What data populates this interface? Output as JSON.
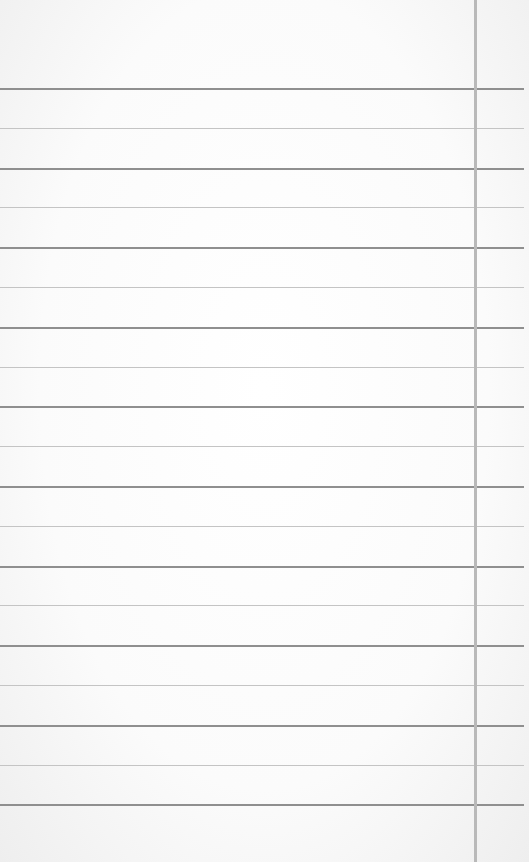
{
  "image": {
    "subject": "blank lined notebook paper",
    "rule_count": 19,
    "has_vertical_margin_line": true,
    "colors": {
      "paper": "#ffffff",
      "rule_dark": "#8f8f8f",
      "rule_light": "#c4c4c4",
      "margin_line": "#b9b9b9"
    }
  }
}
